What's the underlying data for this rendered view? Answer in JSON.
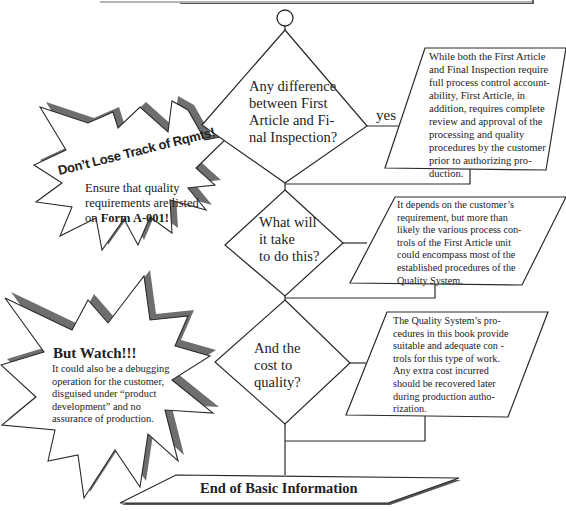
{
  "flowchart": {
    "start_node": "circle",
    "decisions": [
      {
        "id": "d1",
        "text": "Any difference between First Article and Final Inspection?",
        "lines": [
          "Any difference",
          "between First",
          "Article and Fi-",
          "nal Inspection?"
        ],
        "branch_label": "yes"
      },
      {
        "id": "d2",
        "text": "What will it take to do this?",
        "lines": [
          "What will",
          "it take",
          "to do this?"
        ]
      },
      {
        "id": "d3",
        "text": "And the cost to quality?",
        "lines": [
          "And the",
          "cost to",
          "quality?"
        ]
      }
    ],
    "answers": [
      {
        "id": "a1",
        "lines": [
          "While both the First Article",
          "and Final Inspection require",
          "full process control account-",
          "ability, First Article, in",
          "addition, requires complete",
          "review and approval of the",
          "processing and quality",
          "procedures by the customer",
          "prior to authorizing pro-",
          "duction."
        ]
      },
      {
        "id": "a2",
        "lines": [
          "It depends on the customer’s",
          "requirement, but more than",
          "likely the various process con-",
          "trols of the First Article unit",
          "could encompass most of the",
          "established procedures of the",
          "Quality System."
        ]
      },
      {
        "id": "a3",
        "lines": [
          "The Quality System’s pro-",
          "cedures in this book provide",
          "suitable and adequate con -",
          "trols for this type of work.",
          "Any extra cost incurred",
          "should be recovered later",
          "during production autho-",
          "rization."
        ]
      }
    ],
    "end": {
      "label": "End of Basic Information"
    }
  },
  "callouts": [
    {
      "id": "c1",
      "title": "Don’t Lose Track of Rqmts!",
      "body_lines": [
        "Ensure that quality",
        "requirements are listed"
      ],
      "body_last_prefix": "on ",
      "body_last_bold": "Form A-001!"
    },
    {
      "id": "c2",
      "title": "But Watch!!!",
      "body_lines": [
        "It could also be a debugging",
        "operation for the customer,",
        "disguised under “product",
        "development” and no",
        "assurance of production."
      ]
    }
  ],
  "colors": {
    "line": "#2a2a2a",
    "shadow": "#707070",
    "background": "#ffffff"
  }
}
